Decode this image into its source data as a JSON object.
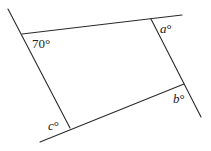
{
  "diagram": {
    "type": "geometry-quadrilateral-with-extended-sides",
    "lines": [
      {
        "name": "top-line",
        "x1": 22,
        "y1": 34,
        "x2": 182,
        "y2": 15
      },
      {
        "name": "left-line",
        "x1": 8,
        "y1": 9,
        "x2": 70,
        "y2": 128
      },
      {
        "name": "right-line",
        "x1": 151,
        "y1": 19,
        "x2": 201,
        "y2": 117
      },
      {
        "name": "bottom-line",
        "x1": 40,
        "y1": 142,
        "x2": 184,
        "y2": 84
      }
    ],
    "labels": {
      "top_left": "70°",
      "top_right_var": "a",
      "bottom_right_var": "b",
      "bottom_left_var": "c",
      "degree": "°"
    }
  }
}
